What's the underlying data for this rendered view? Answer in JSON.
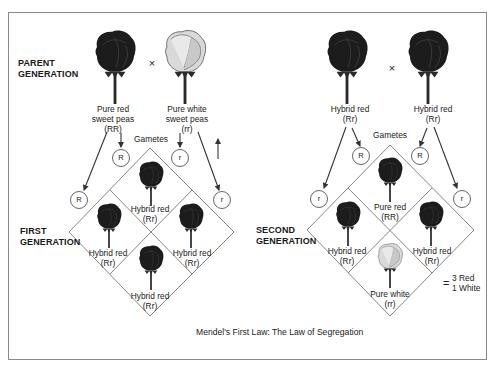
{
  "figure": {
    "caption": "Mendel's First Law: The Law of Segregation",
    "cross_symbol": "×",
    "gametes_label": "Gametes"
  },
  "left_panel": {
    "parent_generation_label": [
      "PARENT",
      "GENERATION"
    ],
    "first_generation_label": [
      "FIRST",
      "GENERATION"
    ],
    "parents": [
      {
        "name": "Pure red sweet peas",
        "lines": [
          "Pure red",
          "sweet peas",
          "(RR)"
        ],
        "genotype": "RR",
        "color": "red"
      },
      {
        "name": "Pure white sweet peas",
        "lines": [
          "Pure white",
          "sweet peas",
          "(rr)"
        ],
        "genotype": "rr",
        "color": "white"
      }
    ],
    "gametes": {
      "inner": [
        "R",
        "r"
      ],
      "outer": [
        "R",
        "r"
      ]
    },
    "offspring": [
      {
        "position": "top",
        "lines": [
          "Hybrid red",
          "(Rr)"
        ],
        "color": "red"
      },
      {
        "position": "left",
        "lines": [
          "Hybrid red",
          "(Rr)"
        ],
        "color": "red"
      },
      {
        "position": "right",
        "lines": [
          "Hybrid red",
          "(Rr)"
        ],
        "color": "red"
      },
      {
        "position": "bottom",
        "lines": [
          "Hybrid red",
          "(Rr)"
        ],
        "color": "red"
      }
    ]
  },
  "right_panel": {
    "second_generation_label": [
      "SECOND",
      "GENERATION"
    ],
    "parents": [
      {
        "name": "Hybrid red",
        "lines": [
          "Hybrid red",
          "(Rr)"
        ],
        "genotype": "Rr",
        "color": "red"
      },
      {
        "name": "Hybrid red",
        "lines": [
          "Hybrid red",
          "(Rr)"
        ],
        "genotype": "Rr",
        "color": "red"
      }
    ],
    "gametes": {
      "inner": [
        "R",
        "R"
      ],
      "outer": [
        "r",
        "r"
      ]
    },
    "offspring": [
      {
        "position": "top",
        "lines": [
          "Pure red",
          "(RR)"
        ],
        "color": "red"
      },
      {
        "position": "left",
        "lines": [
          "Hybrid red",
          "(Rr)"
        ],
        "color": "red"
      },
      {
        "position": "right",
        "lines": [
          "Hybrid red",
          "(Rr)"
        ],
        "color": "red"
      },
      {
        "position": "bottom",
        "lines": [
          "Pure white",
          "(rr)"
        ],
        "color": "white"
      }
    ],
    "ratio": {
      "equals": "=",
      "lines": [
        "3 Red",
        "1 White"
      ]
    }
  },
  "colors": {
    "frame": "#8a8a8a",
    "line": "#777777",
    "arrow": "#333333",
    "rose_dark": "#1c1c1c",
    "rose_white": "#d9d9d9"
  }
}
